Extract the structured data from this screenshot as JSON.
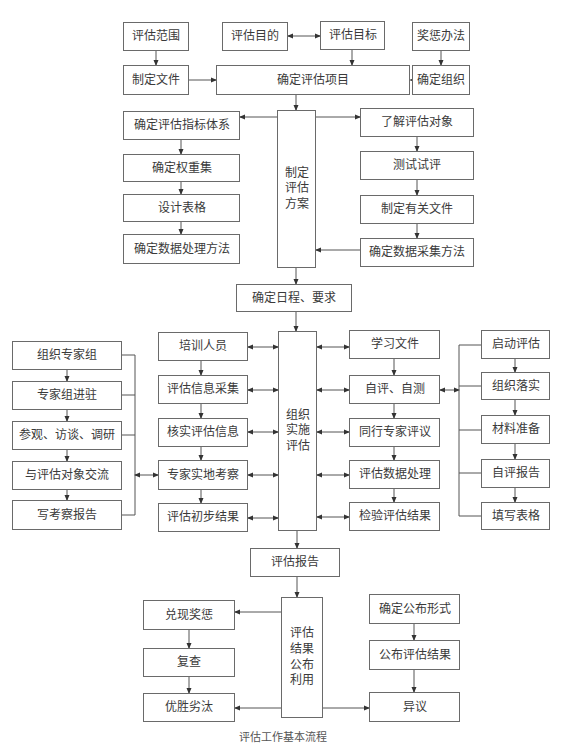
{
  "diagram": {
    "type": "flowchart",
    "top": {
      "scope": "评估范围",
      "purpose": "评估目的",
      "goal": "评估目标",
      "reward": "奖惩办法",
      "make_doc": "制定文件",
      "confirm_project": "确定评估项目",
      "confirm_org": "确定组织"
    },
    "plan": {
      "center": "制定评估方案",
      "left": [
        "确定评估指标体系",
        "确定权重集",
        "设计表格",
        "确定数据处理方法"
      ],
      "right": [
        "了解评估对象",
        "测试试评",
        "制定有关文件",
        "确定数据采集方法"
      ]
    },
    "schedule": "确定日程、要求",
    "implement": {
      "center": "组织实施评估",
      "expert": [
        "组织专家组",
        "专家组进驻",
        "参观、访谈、调研",
        "与评估对象交流",
        "写考察报告"
      ],
      "left": [
        "培训人员",
        "评估信息采集",
        "核实评估信息",
        "专家实地考察",
        "评估初步结果"
      ],
      "right": [
        "学习文件",
        "自评、自测",
        "同行专家评议",
        "评估数据处理",
        "检验评估结果"
      ],
      "self": [
        "启动评估",
        "组织落实",
        "材料准备",
        "自评报告",
        "填写表格"
      ]
    },
    "report": "评估报告",
    "publish": {
      "center": "评估结果公布利用",
      "left": [
        "兑现奖惩",
        "复查",
        "优胜劣汰"
      ],
      "right": [
        "确定公布形式",
        "公布评估结果",
        "异议"
      ]
    }
  },
  "caption": "评估工作基本流程"
}
